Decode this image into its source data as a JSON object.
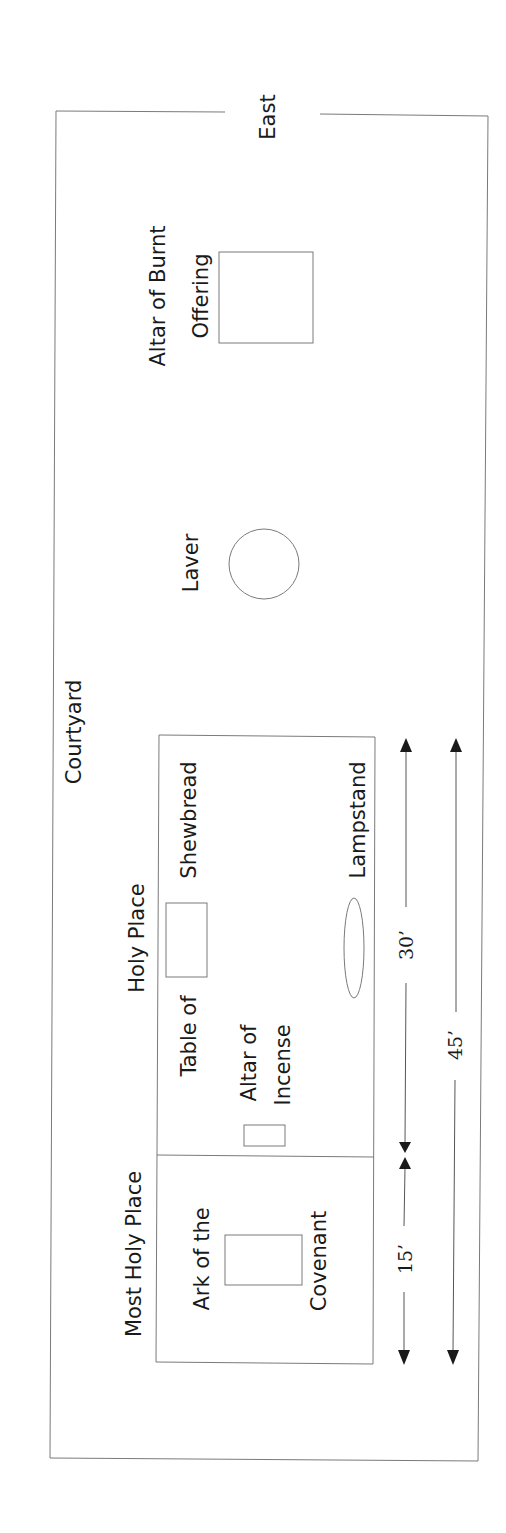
{
  "diagram": {
    "orientation_label": "East",
    "courtyard": {
      "label": "Courtyard"
    },
    "outer_items": {
      "altar_burnt_offering": {
        "line1": "Altar of Burnt",
        "line2": "Offering"
      },
      "laver": {
        "label": "Laver"
      }
    },
    "holy_place": {
      "label": "Holy Place",
      "table": {
        "line1": "Table of",
        "line2": "Shewbread"
      },
      "altar_incense": {
        "line1": "Altar of",
        "line2": "Incense"
      },
      "lampstand": {
        "label": "Lampstand"
      }
    },
    "most_holy_place": {
      "label": "Most Holy Place",
      "ark": {
        "line1": "Ark of the",
        "line2": "Covenant"
      }
    },
    "dimensions": {
      "holy_place_length": "30’",
      "most_holy_length": "15’",
      "total_length": "45’"
    },
    "colors": {
      "line": "#7a7a7a",
      "text": "#1a1a1a",
      "background": "#ffffff"
    }
  }
}
